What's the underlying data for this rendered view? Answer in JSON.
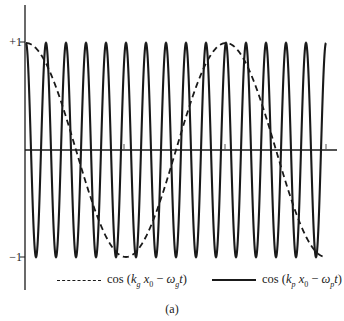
{
  "chart_data": {
    "type": "line",
    "title": "",
    "caption": "(a)",
    "xlabel": "",
    "ylabel": "",
    "ylim": [
      -1,
      1
    ],
    "y_tick_labels": [
      "+1",
      "-1"
    ],
    "x_ticks_count": 3,
    "grid": false,
    "legend_position": "bottom",
    "x_range_periods_group": [
      0,
      3
    ],
    "series": [
      {
        "name": "cos (k_g x_0 − ω_g t)",
        "style": "dashed",
        "function": "cos",
        "periods_shown": 1.5,
        "phase_at_origin": 0
      },
      {
        "name": "cos (k_p x_0 − ω_p t)",
        "style": "solid",
        "function": "cos",
        "periods_shown": 15,
        "phase_at_origin": 0
      }
    ]
  },
  "labels": {
    "y_plus": "+1",
    "y_minus": "−1",
    "legend_dashed": "cos (k_g x_0 − ω_g t)",
    "legend_solid": "cos (k_p x_0 − ω_p t)",
    "caption": "(a)"
  },
  "colors": {
    "ink": "#1a1a1a",
    "background": "#ffffff"
  }
}
